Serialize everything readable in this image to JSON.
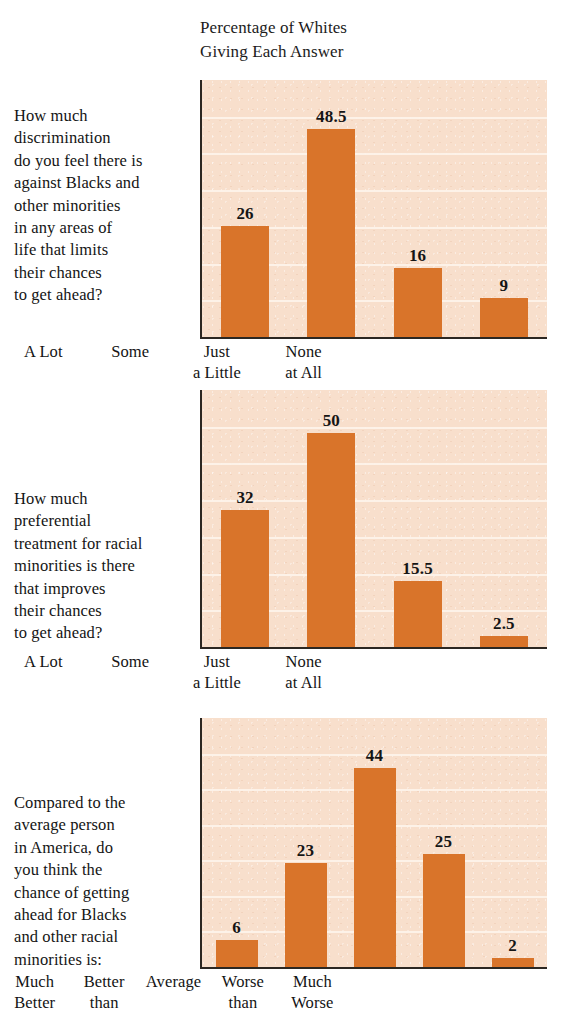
{
  "title": "Percentage of Whites\nGiving Each Answer",
  "colors": {
    "bar": "#d9742a",
    "plot_background": "#f8dfcc",
    "gridline": "#fdf3ea",
    "axis": "#2c2722",
    "text": "#141414"
  },
  "chart_data": [
    {
      "type": "bar",
      "title": "Percentage of Whites Giving Each Answer",
      "question": "How much\ndiscrimination\ndo you feel there is\nagainst Blacks and\nother minorities\nin any areas of\nlife that limits\ntheir chances\nto get ahead?",
      "categories": [
        "A Lot",
        "Some",
        "Just\na Little",
        "None\nat All"
      ],
      "values": [
        26,
        48.5,
        16,
        9
      ],
      "value_labels": [
        "26",
        "48.5",
        "16",
        "9"
      ],
      "xlabel": "",
      "ylabel": "Percentage of Whites Giving Each Answer",
      "ylim": [
        0,
        60
      ],
      "grid": true,
      "gridline_count": 6,
      "legend": "none"
    },
    {
      "type": "bar",
      "title": "Percentage of Whites Giving Each Answer",
      "question": "How much\npreferential\ntreatment for racial\nminorities is there\nthat improves\ntheir chances\nto get ahead?",
      "categories": [
        "A Lot",
        "Some",
        "Just\na Little",
        "None\nat All"
      ],
      "values": [
        32,
        50,
        15.5,
        2.5
      ],
      "value_labels": [
        "32",
        "50",
        "15.5",
        "2.5"
      ],
      "xlabel": "",
      "ylabel": "Percentage of Whites Giving Each Answer",
      "ylim": [
        0,
        60
      ],
      "grid": true,
      "gridline_count": 6,
      "legend": "none"
    },
    {
      "type": "bar",
      "title": "Percentage of Whites Giving Each Answer",
      "question": "Compared to the\naverage person\nin America, do\nyou think the\nchance of getting\nahead for Blacks\nand other racial\nminorities is:",
      "categories": [
        "Much\nBetter",
        "Better\nthan",
        "Average",
        "Worse\nthan",
        "Much\nWorse"
      ],
      "values": [
        6,
        23,
        44,
        25,
        2
      ],
      "value_labels": [
        "6",
        "23",
        "44",
        "25",
        "2"
      ],
      "xlabel": "",
      "ylabel": "Percentage of Whites Giving Each Answer",
      "ylim": [
        0,
        55
      ],
      "grid": true,
      "gridline_count": 6,
      "legend": "none"
    }
  ]
}
